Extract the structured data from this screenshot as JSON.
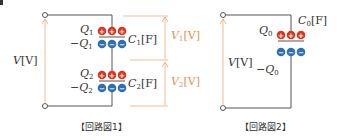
{
  "colors": {
    "wire": "#555555",
    "positive": "#d9371f",
    "negative": "#2f6fb5",
    "voltage_arrow": "#f0a878",
    "voltage_text": "#e8914c"
  },
  "circuit1": {
    "caption": "【回路図1】",
    "source_voltage": {
      "symbol": "V",
      "unit": "[V]"
    },
    "capacitors": [
      {
        "name": "C",
        "sub": "1",
        "unit": "[F]",
        "charge_pos": "Q",
        "charge_neg": "−Q",
        "charge_sub": "1",
        "voltage": "V",
        "voltage_sub": "1",
        "voltage_unit": "[V]"
      },
      {
        "name": "C",
        "sub": "2",
        "unit": "[F]",
        "charge_pos": "Q",
        "charge_neg": "−Q",
        "charge_sub": "2",
        "voltage": "V",
        "voltage_sub": "2",
        "voltage_unit": "[V]"
      }
    ]
  },
  "circuit2": {
    "caption": "【回路図2】",
    "source_voltage": {
      "symbol": "V",
      "unit": "[V]"
    },
    "capacitor": {
      "name": "C",
      "sub": "0",
      "unit": "[F]",
      "charge_pos": "Q",
      "charge_neg": "−Q",
      "charge_sub": "0"
    }
  },
  "charge_glyphs": {
    "plus": "+",
    "minus": "−"
  }
}
